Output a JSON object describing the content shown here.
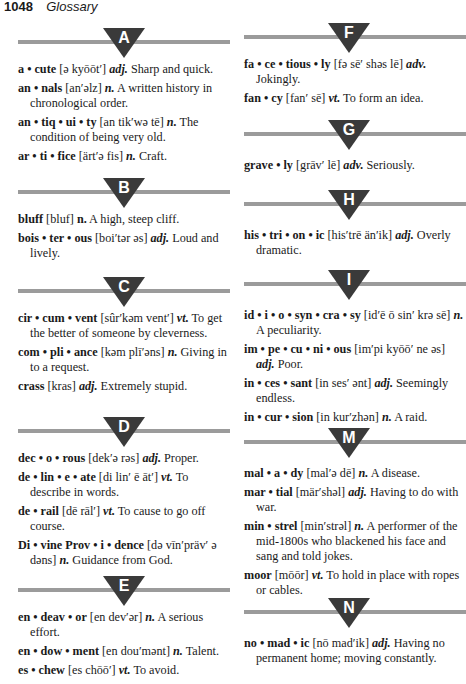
{
  "page": {
    "number": "1048",
    "title": "Glossary"
  },
  "sections": {
    "A": {
      "letter": "A",
      "entries": [
        {
          "hw": "a • cute",
          "pron": "[ə kyōōt′]",
          "pos": "adj.",
          "def": "Sharp and quick."
        },
        {
          "hw": "an • nals",
          "pron": "[an′əlz]",
          "pos": "n.",
          "def": "A written history in chronological order."
        },
        {
          "hw": "an • tiq • ui • ty",
          "pron": "[an tik′wə tē]",
          "pos": "n.",
          "def": "The condition of being very old."
        },
        {
          "hw": "ar • ti • fice",
          "pron": "[ärt′ə fis]",
          "pos": "n.",
          "def": "Craft."
        }
      ]
    },
    "B": {
      "letter": "B",
      "entries": [
        {
          "hw": "bluff",
          "pron": "[bluf]",
          "pos": "n.",
          "def": "A high, steep cliff."
        },
        {
          "hw": "bois • ter • ous",
          "pron": "[boi′tər əs]",
          "pos": "adj.",
          "def": "Loud and lively."
        }
      ]
    },
    "C": {
      "letter": "C",
      "entries": [
        {
          "hw": "cir • cum • vent",
          "pron": "[sûr′kəm vent′]",
          "pos": "vt.",
          "def": "To get the better of someone by cleverness."
        },
        {
          "hw": "com • pli • ance",
          "pron": "[kəm plī′əns]",
          "pos": "n.",
          "def": "Giving in to a request."
        },
        {
          "hw": "crass",
          "pron": "[kras]",
          "pos": "adj.",
          "def": "Extremely stupid."
        }
      ]
    },
    "D": {
      "letter": "D",
      "entries": [
        {
          "hw": "dec • o • rous",
          "pron": "[dek′ə rəs]",
          "pos": "adj.",
          "def": "Proper."
        },
        {
          "hw": "de • lin • e • ate",
          "pron": "[di lin′ ē āt′]",
          "pos": "vt.",
          "def": "To describe in words."
        },
        {
          "hw": "de • rail",
          "pron": "[dē rāl′]",
          "pos": "vt.",
          "def": "To cause to go off course."
        },
        {
          "hw": "Di • vine Prov • i • dence",
          "pron": "[də vīn′präv′ ə dəns]",
          "pos": "n.",
          "def": "Guidance from God."
        }
      ]
    },
    "E": {
      "letter": "E",
      "entries": [
        {
          "hw": "en • deav • or",
          "pron": "[en dev′ər]",
          "pos": "n.",
          "def": "A serious effort."
        },
        {
          "hw": "en • dow • ment",
          "pron": "[en dou′mənt]",
          "pos": "n.",
          "def": "Talent."
        },
        {
          "hw": "es • chew",
          "pron": "[es chōō′]",
          "pos": "vt.",
          "def": "To avoid."
        }
      ]
    },
    "F": {
      "letter": "F",
      "entries": [
        {
          "hw": "fa • ce • tious • ly",
          "pron": "[fə sē′ shəs lē]",
          "pos": "adv.",
          "def": "Jokingly."
        },
        {
          "hw": "fan • cy",
          "pron": "[fan′ sē]",
          "pos": "vt.",
          "def": "To form an idea."
        }
      ]
    },
    "G": {
      "letter": "G",
      "entries": [
        {
          "hw": "grave • ly",
          "pron": "[grāv′ lē]",
          "pos": "adv.",
          "def": "Seriously."
        }
      ]
    },
    "H": {
      "letter": "H",
      "entries": [
        {
          "hw": "his • tri • on • ic",
          "pron": "[his′trē än′ik]",
          "pos": "adj.",
          "def": "Overly dramatic."
        }
      ]
    },
    "I": {
      "letter": "I",
      "entries": [
        {
          "hw": "id • i • o • syn • cra • sy",
          "pron": "[id′ē ō sin′ krə sē]",
          "pos": "n.",
          "def": "A peculiarity."
        },
        {
          "hw": "im • pe • cu • ni • ous",
          "pron": "[im′pi kyōō′ ne əs]",
          "pos": "adj.",
          "def": "Poor."
        },
        {
          "hw": "in • ces • sant",
          "pron": "[in ses′ ənt]",
          "pos": "adj.",
          "def": "Seemingly endless."
        },
        {
          "hw": "in • cur • sion",
          "pron": "[in kur′zhən]",
          "pos": "n.",
          "def": "A raid."
        }
      ]
    },
    "M": {
      "letter": "M",
      "entries": [
        {
          "hw": "mal • a • dy",
          "pron": "[mal′ə dē]",
          "pos": "n.",
          "def": "A disease."
        },
        {
          "hw": "mar • tial",
          "pron": "[mär′shəl]",
          "pos": "adj.",
          "def": "Having to do with war."
        },
        {
          "hw": "min • strel",
          "pron": "[min′strəl]",
          "pos": "n.",
          "def": "A performer of the mid-1800s who blackened his face and sang and told jokes."
        },
        {
          "hw": "moor",
          "pron": "[mōōr]",
          "pos": "vt.",
          "def": "To hold in place with ropes or cables."
        }
      ]
    },
    "N": {
      "letter": "N",
      "entries": [
        {
          "hw": "no • mad • ic",
          "pron": "[nō mad′ik]",
          "pos": "adj.",
          "def": "Having no permanent home; moving constantly."
        }
      ]
    }
  },
  "colors": {
    "divider_bar": "#9b9b9b",
    "triangle": "#3a3a3a",
    "text": "#1a1a1a"
  }
}
